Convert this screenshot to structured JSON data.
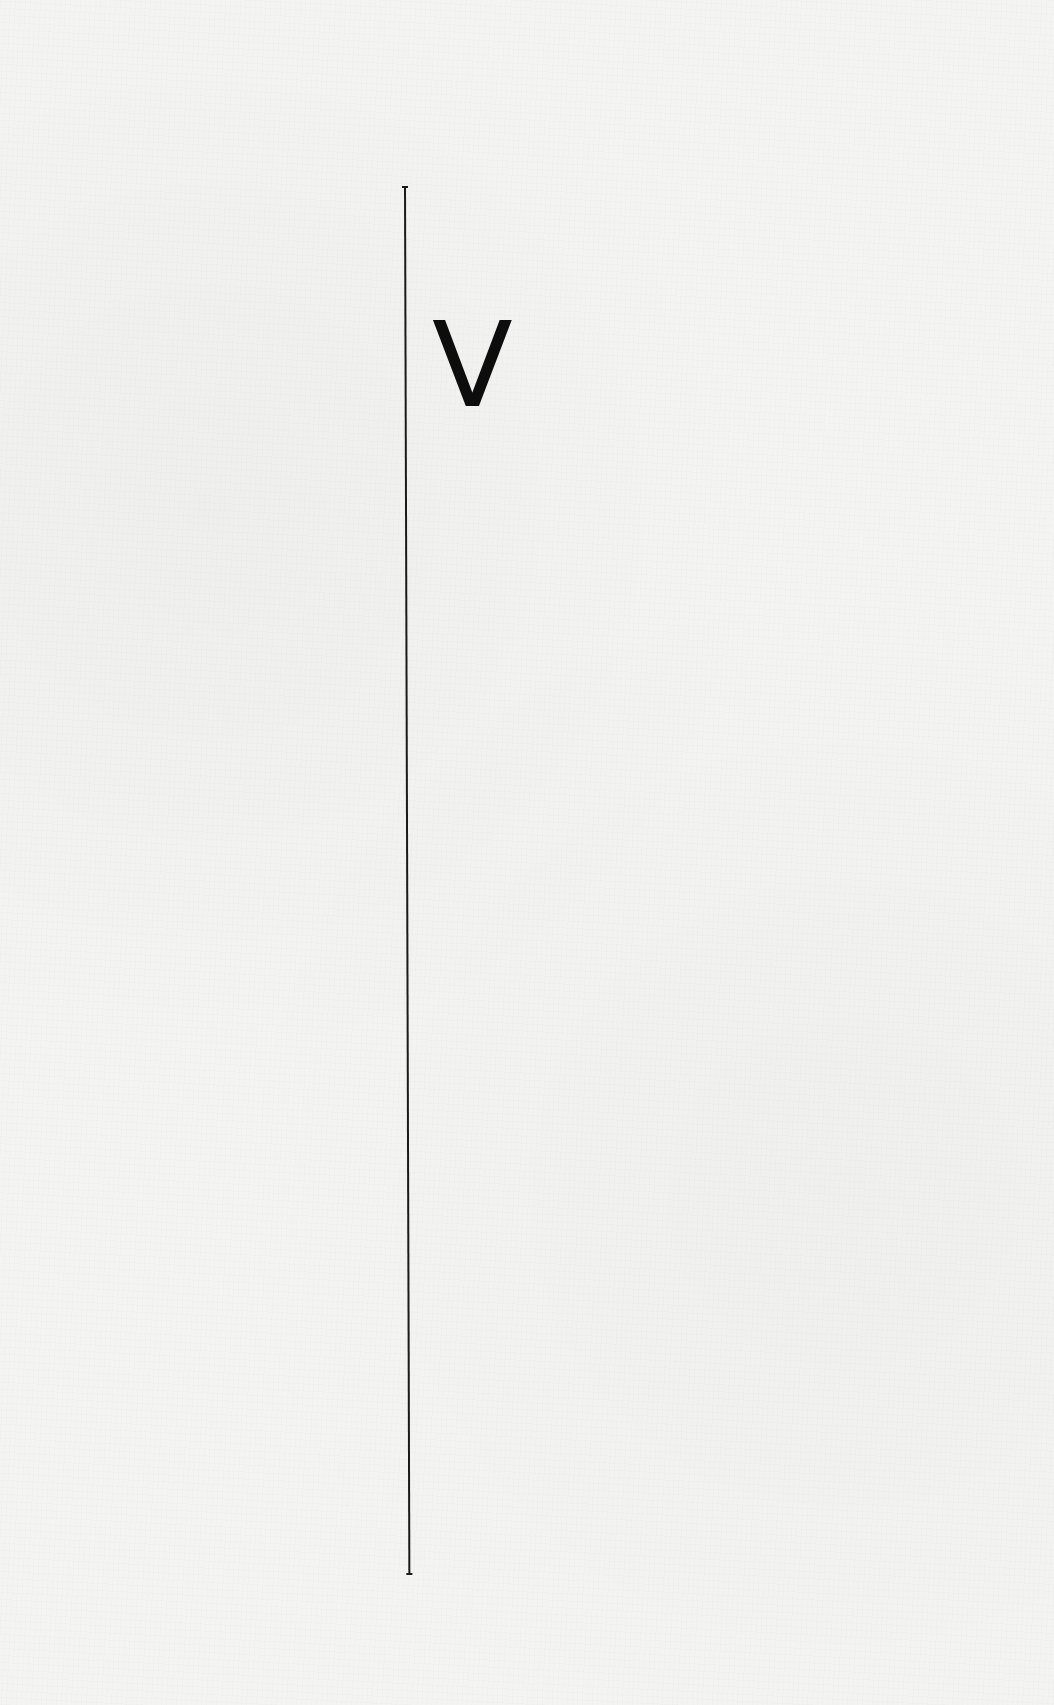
{
  "page": {
    "background_color": "#f4f4f2",
    "rule_color": "#1a1a1a",
    "glyph_color": "#0d0d0d"
  },
  "content": {
    "glyph": "V"
  }
}
